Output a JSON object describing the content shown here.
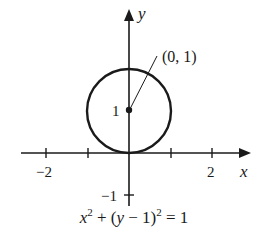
{
  "diagram": {
    "type": "coordinate-plot",
    "axes": {
      "x_label": "x",
      "y_label": "y",
      "x_tick_labels": [
        "−2",
        "2"
      ],
      "y_tick_labels": [
        "1",
        "−1"
      ],
      "x_ticks": [
        -2,
        -1,
        1,
        2
      ],
      "y_ticks": [
        1,
        -1
      ]
    },
    "circle": {
      "center": [
        0,
        1
      ],
      "radius": 1
    },
    "point_annotation": "(0, 1)",
    "equation": {
      "part1": "x",
      "exp1": "2",
      "part2": " + (",
      "part3": "y",
      "part4": " − 1)",
      "exp2": "2",
      "part5": " = 1"
    },
    "colors": {
      "ink": "#1a1a1a",
      "background": "#ffffff"
    }
  }
}
